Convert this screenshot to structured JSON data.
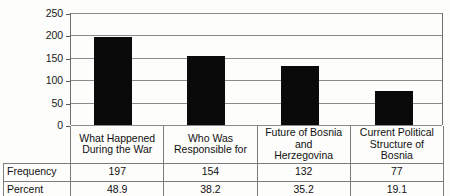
{
  "chart_data": {
    "type": "bar",
    "title": "",
    "xlabel": "",
    "ylabel": "",
    "ylim": [
      0,
      250
    ],
    "yticks": [
      250,
      200,
      150,
      100,
      50,
      0
    ],
    "grid": true,
    "legend": false,
    "bar_color": "#0a0a0a",
    "categories": [
      "What Happened During the War",
      "Who Was Responsible for",
      "Future of Bosnia and Herzegovina",
      "Current Political Structure of Bosnia"
    ],
    "category_lines": [
      [
        "What Happened",
        "During the War"
      ],
      [
        "Who Was",
        "Responsible for"
      ],
      [
        "Future of Bosnia and",
        "Herzegovina"
      ],
      [
        "Current Political",
        "Structure of Bosnia"
      ]
    ],
    "values": [
      197,
      154,
      132,
      77
    ],
    "series": [
      {
        "name": "Frequency",
        "values": [
          197,
          154,
          132,
          77
        ]
      },
      {
        "name": "Percent",
        "values": [
          48.9,
          38.2,
          35.2,
          19.1
        ]
      }
    ]
  },
  "table": {
    "row_labels": [
      "Frequency",
      "Percent"
    ],
    "rows": [
      {
        "label": "Frequency",
        "cells": [
          "197",
          "154",
          "132",
          "77"
        ]
      },
      {
        "label": "Percent",
        "cells": [
          "48.9",
          "38.2",
          "35.2",
          "19.1"
        ]
      }
    ]
  },
  "axis": {
    "ticks": [
      {
        "label": "250"
      },
      {
        "label": "200"
      },
      {
        "label": "150"
      },
      {
        "label": "100"
      },
      {
        "label": "50"
      },
      {
        "label": "0"
      }
    ]
  }
}
